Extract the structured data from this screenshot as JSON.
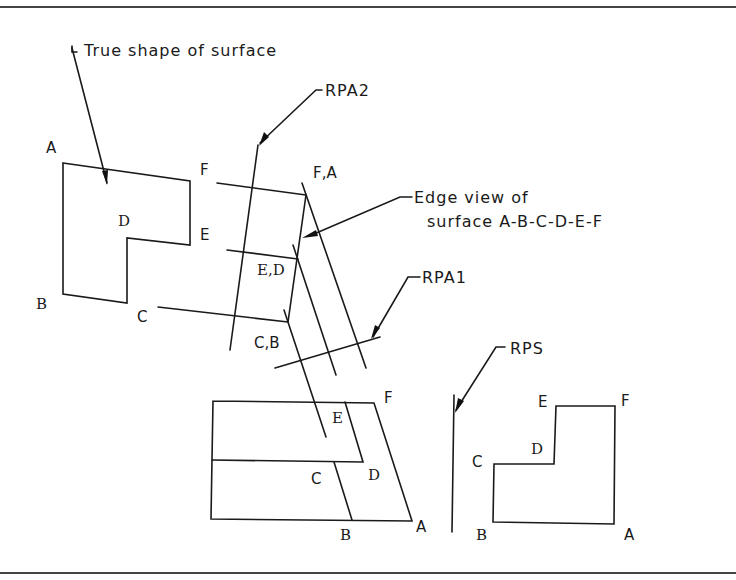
{
  "diagram": {
    "annotations": {
      "true_shape": "True shape of surface",
      "rpa2": "RPA2",
      "edge_view_line1": "Edge view of",
      "edge_view_line2": "surface A-B-C-D-E-F",
      "rpa1": "RPA1",
      "rps": "RPS"
    },
    "true_shape_view": {
      "A": "A",
      "B": "B",
      "C": "C",
      "D": "D",
      "E": "E",
      "F": "F"
    },
    "edge_view": {
      "FA": "F,A",
      "ED": "E,D",
      "CB": "C,B"
    },
    "front_view": {
      "E": "E",
      "F": "F",
      "C": "C",
      "D": "D",
      "B": "B",
      "A": "A"
    },
    "side_view": {
      "E": "E",
      "F": "F",
      "D": "D",
      "C": "C",
      "B": "B",
      "A": "A"
    },
    "colors": {
      "line": "#1a1a1a",
      "border": "#444444",
      "background": "#ffffff"
    }
  }
}
